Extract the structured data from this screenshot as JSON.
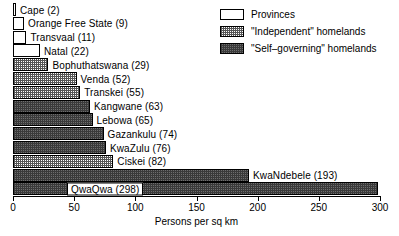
{
  "chart_data": {
    "type": "bar",
    "orientation": "horizontal",
    "title": "",
    "xlabel": "Persons per sq km",
    "ylabel": "",
    "xlim": [
      0,
      300
    ],
    "xticks": [
      0,
      50,
      100,
      150,
      200,
      250,
      300
    ],
    "grid": false,
    "legend_position": "top-right",
    "categories": [
      "Cape",
      "Orange Free State",
      "Transvaal",
      "Natal",
      "Bophuthatswana",
      "Venda",
      "Transkei",
      "Kangwane",
      "Lebowa",
      "Gazankulu",
      "KwaZulu",
      "Ciskei",
      "KwaNdebele",
      "QwaQwa"
    ],
    "values": [
      2,
      9,
      11,
      22,
      29,
      52,
      55,
      63,
      65,
      74,
      76,
      82,
      193,
      298
    ],
    "series": [
      {
        "name": "Persons per sq km",
        "values": [
          2,
          9,
          11,
          22,
          29,
          52,
          55,
          63,
          65,
          74,
          76,
          82,
          193,
          298
        ]
      }
    ],
    "bars": [
      {
        "label": "Cape (2)",
        "name": "Cape",
        "value": 2,
        "group": "provinces",
        "label_position": "outside"
      },
      {
        "label": "Orange Free State (9)",
        "name": "Orange Free State",
        "value": 9,
        "group": "provinces",
        "label_position": "outside"
      },
      {
        "label": "Transvaal (11)",
        "name": "Transvaal",
        "value": 11,
        "group": "provinces",
        "label_position": "outside"
      },
      {
        "label": "Natal (22)",
        "name": "Natal",
        "value": 22,
        "group": "provinces",
        "label_position": "outside"
      },
      {
        "label": "Bophuthatswana (29)",
        "name": "Bophuthatswana",
        "value": 29,
        "group": "independent",
        "label_position": "outside"
      },
      {
        "label": "Venda (52)",
        "name": "Venda",
        "value": 52,
        "group": "independent",
        "label_position": "outside"
      },
      {
        "label": "Transkei (55)",
        "name": "Transkei",
        "value": 55,
        "group": "independent",
        "label_position": "outside"
      },
      {
        "label": "Kangwane (63)",
        "name": "Kangwane",
        "value": 63,
        "group": "selfgov",
        "label_position": "outside"
      },
      {
        "label": "Lebowa (65)",
        "name": "Lebowa",
        "value": 65,
        "group": "selfgov",
        "label_position": "outside"
      },
      {
        "label": "Gazankulu (74)",
        "name": "Gazankulu",
        "value": 74,
        "group": "selfgov",
        "label_position": "outside"
      },
      {
        "label": "KwaZulu (76)",
        "name": "KwaZulu",
        "value": 76,
        "group": "selfgov",
        "label_position": "outside"
      },
      {
        "label": "Ciskei (82)",
        "name": "Ciskei",
        "value": 82,
        "group": "independent",
        "label_position": "outside"
      },
      {
        "label": "KwaNdebele (193)",
        "name": "KwaNdebele",
        "value": 193,
        "group": "selfgov",
        "label_position": "outside"
      },
      {
        "label": "QwaQwa (298)",
        "name": "QwaQwa",
        "value": 298,
        "group": "selfgov",
        "label_position": "inside"
      }
    ],
    "legend": [
      {
        "label": "Provinces",
        "group": "provinces"
      },
      {
        "label": "\"Independent\" homelands",
        "group": "independent"
      },
      {
        "label": "\"Self–governing\" homelands",
        "group": "selfgov"
      }
    ],
    "colors": {
      "provinces": "#ffffff",
      "independent": "#ffffff",
      "selfgov": "#6e6e6e",
      "outline": "#000000",
      "text": "#000000",
      "background": "#ffffff"
    }
  }
}
